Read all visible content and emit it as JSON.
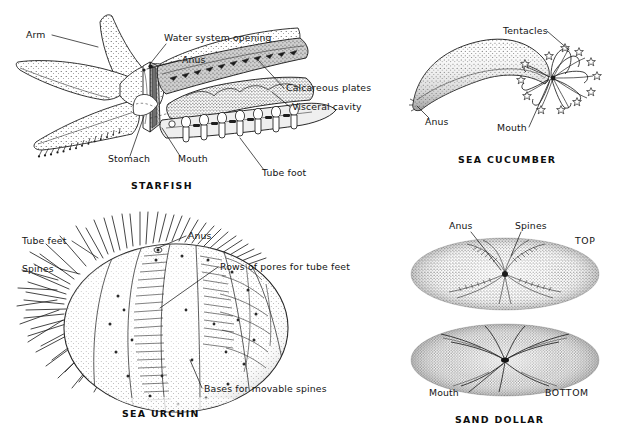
{
  "figure": {
    "background_color": "#ffffff",
    "ink_color": "#1d1d1d"
  },
  "panels": [
    {
      "id": "starfish",
      "caption": "STARFISH",
      "labels": [
        {
          "key": "arm",
          "text": "Arm"
        },
        {
          "key": "water_system_opening",
          "text": "Water system opening"
        },
        {
          "key": "anus",
          "text": "Anus"
        },
        {
          "key": "calcareous_plates",
          "text": "Calcareous plates"
        },
        {
          "key": "visceral_cavity",
          "text": "Visceral cavity"
        },
        {
          "key": "stomach",
          "text": "Stomach"
        },
        {
          "key": "mouth",
          "text": "Mouth"
        },
        {
          "key": "tube_foot",
          "text": "Tube foot"
        }
      ]
    },
    {
      "id": "cucumber",
      "caption": "SEA CUCUMBER",
      "labels": [
        {
          "key": "tentacles",
          "text": "Tentacles"
        },
        {
          "key": "anus",
          "text": "Anus"
        },
        {
          "key": "mouth",
          "text": "Mouth"
        }
      ]
    },
    {
      "id": "urchin",
      "caption": "SEA URCHIN",
      "labels": [
        {
          "key": "tube_feet",
          "text": "Tube feet"
        },
        {
          "key": "spines",
          "text": "Spines"
        },
        {
          "key": "anus",
          "text": "Anus"
        },
        {
          "key": "rows_of_pores",
          "text": "Rows of pores for tube feet"
        },
        {
          "key": "bases_for_movable_spines",
          "text": "Bases for movable spines"
        }
      ]
    },
    {
      "id": "sanddollar",
      "caption": "SAND DOLLAR",
      "labels": [
        {
          "key": "anus",
          "text": "Anus"
        },
        {
          "key": "spines",
          "text": "Spines"
        },
        {
          "key": "mouth",
          "text": "Mouth"
        },
        {
          "key": "top",
          "text": "TOP"
        },
        {
          "key": "bottom",
          "text": "BOTTOM"
        }
      ]
    }
  ]
}
